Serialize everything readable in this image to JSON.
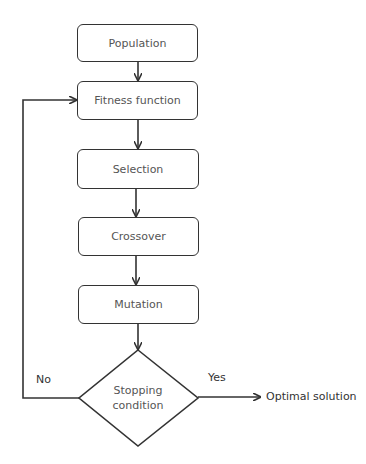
{
  "diagram": {
    "type": "flowchart",
    "nodes": {
      "population": "Population",
      "fitness": "Fitness function",
      "selection": "Selection",
      "crossover": "Crossover",
      "mutation": "Mutation",
      "decision_line1": "Stopping",
      "decision_line2": "condition",
      "output": "Optimal solution"
    },
    "edges": {
      "yes_label": "Yes",
      "no_label": "No"
    },
    "colors": {
      "stroke": "#333333",
      "text": "#555555",
      "background": "#ffffff"
    }
  }
}
